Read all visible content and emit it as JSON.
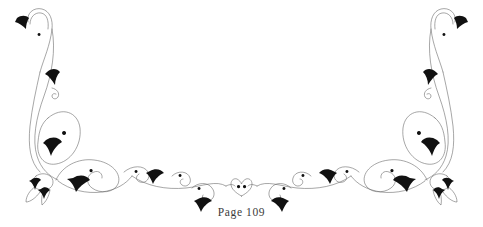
{
  "page": {
    "width": 483,
    "height": 227,
    "background_color": "#ffffff",
    "label": "Page 109",
    "label_color": "#3b3b3b"
  },
  "ornament": {
    "name": "symmetric-calligraphic-flourish-vignette",
    "description": "Decorative page-bottom vignette of mirrored scrolling vines with leaf terminals, spiral curls, petal loops, ribbon knots and a central heart motif",
    "stroke_color": "#6b6b6b",
    "fill_color": "#111111",
    "stroke_width": 0.6,
    "symmetry": "left-right mirrored about x=241.5",
    "elements": [
      {
        "id": "left-tall-stem",
        "type": "scroll-stem",
        "side": "left"
      },
      {
        "id": "left-top-hook",
        "type": "hook-curl",
        "side": "left"
      },
      {
        "id": "left-top-leaf",
        "type": "leaf-arrowhead",
        "side": "left"
      },
      {
        "id": "left-mid-leaf",
        "type": "leaf-arrowhead",
        "side": "left"
      },
      {
        "id": "left-petal-loop",
        "type": "petal-loop",
        "side": "left"
      },
      {
        "id": "left-ribbon-knot",
        "type": "ribbon-knot",
        "side": "left"
      },
      {
        "id": "left-lower-scroll",
        "type": "scroll-loop",
        "side": "left"
      },
      {
        "id": "left-sweep",
        "type": "horizontal-sweep",
        "side": "left"
      },
      {
        "id": "center-heart",
        "type": "heart-motif",
        "side": "center"
      },
      {
        "id": "right-sweep",
        "type": "horizontal-sweep",
        "side": "right"
      },
      {
        "id": "right-lower-scroll",
        "type": "scroll-loop",
        "side": "right"
      },
      {
        "id": "right-ribbon-knot",
        "type": "ribbon-knot",
        "side": "right"
      },
      {
        "id": "right-petal-loop",
        "type": "petal-loop",
        "side": "right"
      },
      {
        "id": "right-mid-leaf",
        "type": "leaf-arrowhead",
        "side": "right"
      },
      {
        "id": "right-top-leaf",
        "type": "leaf-arrowhead",
        "side": "right"
      },
      {
        "id": "right-top-hook",
        "type": "hook-curl",
        "side": "right"
      },
      {
        "id": "right-tall-stem",
        "type": "scroll-stem",
        "side": "right"
      }
    ]
  }
}
